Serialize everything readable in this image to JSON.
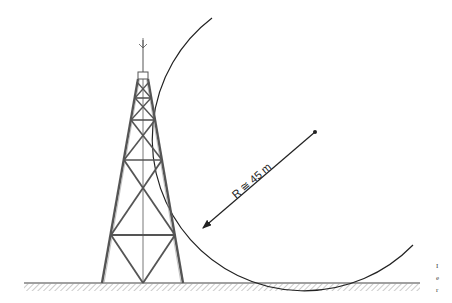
{
  "figure": {
    "label": {
      "symbol": "R",
      "relation": "≅",
      "value": "45 m",
      "full": "R ≅ 45 m"
    },
    "colors": {
      "line": "#222222",
      "tower": "#555555",
      "ground": "#888888",
      "background": "#ffffff"
    },
    "edge_fragments": [
      "I",
      "e",
      "r"
    ]
  }
}
